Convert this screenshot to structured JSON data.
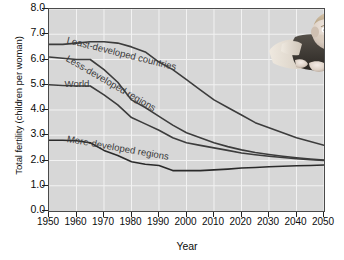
{
  "chart_data": {
    "type": "line",
    "title": "",
    "xlabel": "Year",
    "ylabel": "Total fertility (children per woman)",
    "xlim": [
      1950,
      2050
    ],
    "ylim": [
      0.0,
      8.0
    ],
    "grid": true,
    "legend_position": "inline-on-curves",
    "x": [
      1950,
      1955,
      1960,
      1965,
      1970,
      1975,
      1980,
      1985,
      1990,
      1995,
      2000,
      2005,
      2010,
      2015,
      2020,
      2025,
      2030,
      2035,
      2040,
      2045,
      2050
    ],
    "xticks": [
      "1950",
      "1960",
      "1970",
      "1980",
      "1990",
      "2000",
      "2010",
      "2020",
      "2030",
      "2040",
      "2050"
    ],
    "yticks": [
      "0.0",
      "1.0",
      "2.0",
      "3.0",
      "4.0",
      "5.0",
      "6.0",
      "7.0",
      "8.0"
    ],
    "series": [
      {
        "name": "Least-developed countries",
        "color": "#3c3c3c",
        "label_rotation": 14,
        "values": [
          6.6,
          6.6,
          6.65,
          6.7,
          6.7,
          6.65,
          6.5,
          6.3,
          5.9,
          5.6,
          5.2,
          4.8,
          4.4,
          4.1,
          3.8,
          3.5,
          3.3,
          3.1,
          2.9,
          2.75,
          2.6
        ]
      },
      {
        "name": "Less-developed regions",
        "color": "#3c3c3c",
        "label_rotation": 30,
        "values": [
          6.1,
          6.05,
          6.0,
          6.0,
          5.6,
          5.1,
          4.4,
          4.1,
          3.75,
          3.4,
          3.1,
          2.9,
          2.7,
          2.55,
          2.42,
          2.32,
          2.24,
          2.17,
          2.11,
          2.06,
          2.02
        ]
      },
      {
        "name": "World",
        "color": "#3c3c3c",
        "label_rotation": 0,
        "values": [
          5.0,
          4.97,
          4.95,
          4.95,
          4.6,
          4.2,
          3.7,
          3.45,
          3.2,
          2.9,
          2.7,
          2.6,
          2.5,
          2.4,
          2.3,
          2.23,
          2.17,
          2.12,
          2.07,
          2.03,
          2.0
        ]
      },
      {
        "name": "More-developed regions",
        "color": "#2a2a2a",
        "label_rotation": 10,
        "values": [
          2.8,
          2.8,
          2.78,
          2.7,
          2.4,
          2.2,
          1.95,
          1.85,
          1.8,
          1.6,
          1.6,
          1.6,
          1.63,
          1.66,
          1.7,
          1.72,
          1.75,
          1.77,
          1.79,
          1.8,
          1.82
        ]
      }
    ]
  },
  "photo": {
    "name": "baby-photo",
    "alt": "Infant lying on stomach"
  }
}
